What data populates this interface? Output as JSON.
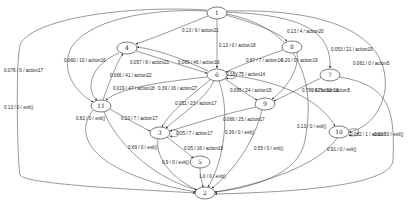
{
  "graph": {
    "type": "state-transition-diagram",
    "nodes": [
      {
        "id": "1",
        "x": 217,
        "y": 13,
        "rx": 10,
        "ry": 6
      },
      {
        "id": "4",
        "x": 127,
        "y": 48,
        "rx": 10,
        "ry": 6
      },
      {
        "id": "8",
        "x": 292,
        "y": 47,
        "rx": 10,
        "ry": 6
      },
      {
        "id": "6",
        "x": 217,
        "y": 75,
        "rx": 10,
        "ry": 6
      },
      {
        "id": "7",
        "x": 330,
        "y": 75,
        "rx": 10,
        "ry": 6
      },
      {
        "id": "11",
        "x": 101,
        "y": 106,
        "rx": 10,
        "ry": 6
      },
      {
        "id": "9",
        "x": 265,
        "y": 104,
        "rx": 10,
        "ry": 6
      },
      {
        "id": "10",
        "x": 339,
        "y": 132,
        "rx": 10,
        "ry": 6
      },
      {
        "id": "3",
        "x": 160,
        "y": 133,
        "rx": 10,
        "ry": 6
      },
      {
        "id": "5",
        "x": 200,
        "y": 162,
        "rx": 10,
        "ry": 6
      },
      {
        "id": "2",
        "x": 205,
        "y": 193,
        "rx": 10,
        "ry": 6
      }
    ],
    "edges": [
      {
        "from": "1",
        "to": "4",
        "label": "0.13 / 9 / action21",
        "d": "M208,16 C185,25 160,36 136,44",
        "lx": 182,
        "ly": 32
      },
      {
        "from": "1",
        "to": "6",
        "label": "0.13 / 0 / action18",
        "d": "M217,19 C217,40 217,55 217,68",
        "lx": 219,
        "ly": 47
      },
      {
        "from": "1",
        "to": "8",
        "label": "0.13 / 4 / action20",
        "d": "M226,15 C250,22 275,30 287,41",
        "lx": 287,
        "ly": 33
      },
      {
        "from": "1",
        "to": "7",
        "label": "0.053 / 21 / action19",
        "d": "M226,12 C300,15 332,30 330,68",
        "lx": 331,
        "ly": 51
      },
      {
        "from": "1",
        "to": "10",
        "label": "0.061 / 0 / action5",
        "d": "M227,11 C340,8 390,40 385,90 C380,120 360,130 349,132",
        "lx": 353,
        "ly": 65
      },
      {
        "from": "1",
        "to": "11",
        "label": "0.076 / 0 / action17",
        "d": "M207,11 C150,8 85,20 70,50 C60,75 80,95 93,102",
        "lx": 4,
        "ly": 72
      },
      {
        "from": "1",
        "to": "2",
        "label": "0.13 / 0 / exit()",
        "d": "M207,10 C120,5 30,20 20,45 C15,70 18,170 20,175 C25,185 150,190 195,193",
        "lx": 4,
        "ly": 109
      },
      {
        "from": "1",
        "to": "2",
        "label": "0.13 / 0 / exit()",
        "d": "M227,14 C280,25 320,60 305,140 C300,175 250,188 215,192",
        "lx": 297,
        "ly": 128
      },
      {
        "from": "4",
        "to": "11",
        "label": "0.060 / 10 / action16",
        "d": "M119,53 C90,65 85,90 97,100",
        "lx": 64,
        "ly": 62
      },
      {
        "from": "4",
        "to": "6",
        "label": "0.057 / 8 / action21",
        "d": "M136,51 C165,60 190,68 207,73",
        "lx": 130,
        "ly": 64
      },
      {
        "from": "6",
        "to": "4",
        "label": "0.069 / 46 / action16",
        "d": "M208,71 C185,60 160,50 137,47",
        "lx": 178,
        "ly": 64
      },
      {
        "from": "6",
        "to": "11",
        "label": "0.019 / 47 / action18",
        "d": "M207,77 C160,82 120,88 106,100",
        "lx": 113,
        "ly": 90
      },
      {
        "from": "11",
        "to": "4",
        "label": "0.066 / 41 / action22",
        "d": "M103,100 C110,80 118,60 123,54",
        "lx": 110,
        "ly": 77
      },
      {
        "from": "6",
        "to": "3",
        "label": "0.39 / 16 / action27",
        "d": "M210,80 C185,100 168,115 162,127",
        "lx": 158,
        "ly": 90
      },
      {
        "from": "8",
        "to": "6",
        "label": "0.87 / 7 / action14",
        "d": "M283,50 C260,58 238,66 226,72",
        "lx": 246,
        "ly": 62
      },
      {
        "from": "8",
        "to": "9",
        "label": "0.20 / 0 / action19",
        "d": "M297,52 C300,70 285,90 272,99",
        "lx": 281,
        "ly": 62
      },
      {
        "from": "6",
        "to": "6",
        "label": "0.16 / 75 / action14",
        "d": "M226,72 C240,68 240,82 226,78",
        "lx": 226,
        "ly": 76
      },
      {
        "from": "6",
        "to": "9",
        "label": "0.095 / 24 / action15",
        "d": "M225,79 C238,88 250,96 257,100",
        "lx": 230,
        "ly": 92
      },
      {
        "from": "6",
        "to": "10",
        "label": "0.025 / 32 / action5",
        "d": "M227,75 C280,80 320,100 335,126",
        "lx": 311,
        "ly": 92
      },
      {
        "from": "7",
        "to": "9",
        "label": "0.78 / 4 / action13",
        "d": "M321,78 C300,88 285,96 274,101",
        "lx": 302,
        "ly": 92
      },
      {
        "from": "7",
        "to": "2",
        "label": "0.32 / 0 / exit()",
        "d": "M339,77 C390,85 395,110 393,160 C392,185 300,192 215,194",
        "lx": 374,
        "ly": 136
      },
      {
        "from": "10",
        "to": "10",
        "label": "0.082 / 1 / action5",
        "d": "M349,130 C362,124 362,140 349,135",
        "lx": 350,
        "ly": 136
      },
      {
        "from": "10",
        "to": "2",
        "label": "0.91 / 0 / exit()",
        "d": "M337,138 C320,165 260,185 215,192",
        "lx": 327,
        "ly": 151
      },
      {
        "from": "6",
        "to": "3",
        "label": "0.051 / 23 / action17",
        "d": "M214,81 C205,100 180,115 166,128",
        "lx": 175,
        "ly": 105
      },
      {
        "from": "9",
        "to": "3",
        "label": "0.066 / 25 / action17",
        "d": "M256,107 C220,115 190,125 170,131",
        "lx": 223,
        "ly": 121
      },
      {
        "from": "9",
        "to": "2",
        "label": "0.55 / 0 / exit()",
        "d": "M262,110 C255,140 235,170 212,188",
        "lx": 254,
        "ly": 150
      },
      {
        "from": "6",
        "to": "2",
        "label": "0.39 / 0 / exit()",
        "d": "M219,81 C230,110 225,160 208,187",
        "lx": 225,
        "ly": 134
      },
      {
        "from": "11",
        "to": "3",
        "label": "0.23 / 7 / action17",
        "d": "M110,109 C125,118 140,126 150,131",
        "lx": 121,
        "ly": 120
      },
      {
        "from": "11",
        "to": "2",
        "label": "0.82 / 0 / exit()",
        "d": "M93,110 C70,140 100,175 196,192",
        "lx": 76,
        "ly": 120
      },
      {
        "from": "11",
        "to": "2",
        "label": "0.69 / 0 / exit()",
        "d": "M104,112 C120,150 160,180 197,190",
        "lx": 128,
        "ly": 149
      },
      {
        "from": "3",
        "to": "3",
        "label": "0.05 / 7 / action17",
        "d": "M170,131 C182,126 182,140 170,136",
        "lx": 176,
        "ly": 135
      },
      {
        "from": "3",
        "to": "5",
        "label": "0.05 / 16 / action16",
        "d": "M167,137 C178,146 188,153 193,158",
        "lx": 184,
        "ly": 150
      },
      {
        "from": "3",
        "to": "2",
        "label": "0.9 / 0 / exit()",
        "d": "M158,139 C155,160 175,180 197,190",
        "lx": 162,
        "ly": 164
      },
      {
        "from": "5",
        "to": "2",
        "label": "1.0 / 0 / exit()",
        "d": "M200,168 C200,176 202,182 203,187",
        "lx": 199,
        "ly": 178
      }
    ]
  }
}
